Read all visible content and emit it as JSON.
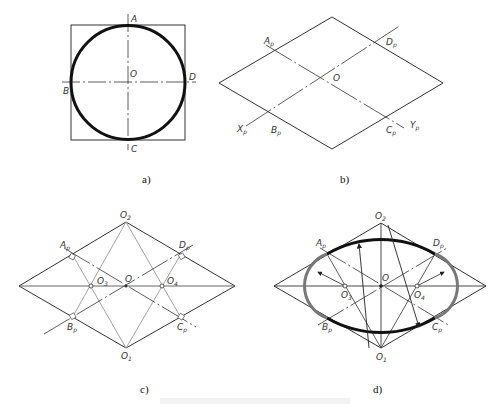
{
  "figure": {
    "panels": [
      {
        "id": "a",
        "caption": "a)",
        "labels": {
          "A": "A",
          "B": "B",
          "C": "C",
          "D": "D",
          "O": "O"
        },
        "description": "Circle inscribed in square with centerlines"
      },
      {
        "id": "b",
        "caption": "b)",
        "labels": {
          "Ap": "A",
          "Bp": "B",
          "Cp": "C",
          "Dp": "D",
          "O": "O",
          "Xp": "X",
          "Yp": "Y",
          "sub": "p"
        },
        "description": "Isometric rhombus with axes Xp, Yp"
      },
      {
        "id": "c",
        "caption": "c)",
        "labels": {
          "Ap": "A",
          "Bp": "B",
          "Cp": "C",
          "Dp": "D",
          "O": "O",
          "O1": "O",
          "O2": "O",
          "O3": "O",
          "O4": "O",
          "sub": "p",
          "n1": "1",
          "n2": "2",
          "n3": "3",
          "n4": "4"
        },
        "description": "Construction of four arc centers O1–O4"
      },
      {
        "id": "d",
        "caption": "d)",
        "labels": {
          "Ap": "A",
          "Bp": "B",
          "Cp": "C",
          "Dp": "D",
          "O": "O",
          "O1": "O",
          "O2": "O",
          "O3": "O",
          "O4": "O",
          "sub": "p",
          "n1": "1",
          "n2": "2",
          "n3": "3",
          "n4": "4"
        },
        "description": "Four-center approximate isometric ellipse"
      }
    ],
    "colors": {
      "line": "#222222",
      "thick": "#111111",
      "gray": "#888888",
      "construction": "#999999"
    }
  }
}
